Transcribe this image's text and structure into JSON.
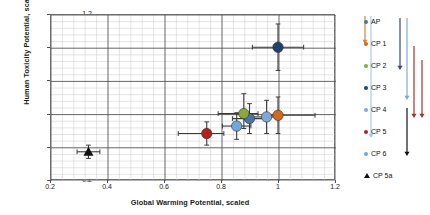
{
  "chart_data": {
    "type": "scatter",
    "title": "",
    "xlabel": "Global Warming Potential, scaled",
    "ylabel": "Human Toxicity Potential, scaled",
    "xlim": [
      0.2,
      1.2
    ],
    "ylim": [
      0.2,
      1.2
    ],
    "xticks": [
      "0.2",
      "0.4",
      "0.6",
      "0.8",
      "1",
      "1.2"
    ],
    "xtick_values": [
      0.2,
      0.4,
      0.6,
      0.8,
      1.0,
      1.2
    ],
    "yticks": [
      "0.2",
      "0.4",
      "0.6",
      "0.8",
      "1",
      "1.2"
    ],
    "ytick_values": [
      0.2,
      0.4,
      0.6,
      0.8,
      1.0,
      1.2
    ],
    "grid": true,
    "grid_minor_divisions": 5,
    "legend_position": "right",
    "points": [
      {
        "name": "AP",
        "color": "#4874a8",
        "marker": "circle",
        "x": 0.9,
        "y": 0.57,
        "xerr_low": 0.06,
        "xerr_high": 0.06,
        "yerr_low": 0.09,
        "yerr_high": 0.09
      },
      {
        "name": "CP 1",
        "color": "#d2691e",
        "marker": "circle",
        "x": 1.0,
        "y": 0.59,
        "xerr_low": 0.05,
        "xerr_high": 0.13,
        "yerr_low": 0.11,
        "yerr_high": 0.11
      },
      {
        "name": "CP 2",
        "color": "#8aa83c",
        "marker": "circle",
        "x": 0.88,
        "y": 0.6,
        "xerr_low": 0.09,
        "xerr_high": 0.05,
        "yerr_low": 0.09,
        "yerr_high": 0.12
      },
      {
        "name": "CP 3",
        "color": "#22406e",
        "marker": "circle",
        "x": 1.0,
        "y": 1.0,
        "xerr_low": 0.09,
        "xerr_high": 0.09,
        "yerr_low": 0.14,
        "yerr_high": 0.14
      },
      {
        "name": "CP 4",
        "color": "#7fa9d4",
        "marker": "circle",
        "x": 0.96,
        "y": 0.58,
        "xerr_low": 0.06,
        "xerr_high": 0.05,
        "yerr_low": 0.1,
        "yerr_high": 0.1
      },
      {
        "name": "CP 5",
        "color": "#b32020",
        "marker": "circle",
        "x": 0.75,
        "y": 0.48,
        "xerr_low": 0.1,
        "xerr_high": 0.06,
        "yerr_low": 0.07,
        "yerr_high": 0.07
      },
      {
        "name": "CP 6",
        "color": "#6fa8dc",
        "marker": "circle",
        "x": 0.855,
        "y": 0.525,
        "xerr_low": 0.05,
        "xerr_high": 0.05,
        "yerr_low": 0.08,
        "yerr_high": 0.08
      },
      {
        "name": "CP 5a",
        "color": "#111111",
        "marker": "triangle",
        "x": 0.335,
        "y": 0.37,
        "xerr_low": 0.04,
        "xerr_high": 0.04,
        "yerr_low": 0.04,
        "yerr_high": 0.04
      }
    ]
  },
  "legend": {
    "items": [
      {
        "label": "AP",
        "color": "#4874a8",
        "marker": "circle"
      },
      {
        "label": "CP 1",
        "color": "#d2691e",
        "marker": "circle"
      },
      {
        "label": "CP 2",
        "color": "#8aa83c",
        "marker": "circle"
      },
      {
        "label": "CP 3",
        "color": "#22406e",
        "marker": "circle"
      },
      {
        "label": "CP 4",
        "color": "#7fa9d4",
        "marker": "circle"
      },
      {
        "label": "CP 5",
        "color": "#b32020",
        "marker": "circle"
      },
      {
        "label": "CP 6",
        "color": "#6fa8dc",
        "marker": "circle"
      },
      {
        "label": "CP 5a",
        "color": "#111111",
        "marker": "triangle"
      }
    ],
    "arrows": [
      {
        "name": "orange-arrow",
        "color": "#d2843c",
        "x": 9,
        "y1": 8,
        "y2": 36
      },
      {
        "name": "lightblue-line",
        "color": "#a9cbe6",
        "x": 15,
        "y1": 8,
        "y2": 130
      },
      {
        "name": "navy-arrow",
        "color": "#3a4a66",
        "x": 44,
        "y1": 10,
        "y2": 62
      },
      {
        "name": "lightblue-arrow",
        "color": "#7fa9d4",
        "x": 51,
        "y1": 10,
        "y2": 92
      },
      {
        "name": "darkred-arrow-1",
        "color": "#a83232",
        "x": 58,
        "y1": 38,
        "y2": 110
      },
      {
        "name": "darkred-arrow-2",
        "color": "#a83232",
        "x": 66,
        "y1": 52,
        "y2": 110
      },
      {
        "name": "black-arrow",
        "color": "#111111",
        "x": 51,
        "y1": 100,
        "y2": 148
      }
    ]
  }
}
